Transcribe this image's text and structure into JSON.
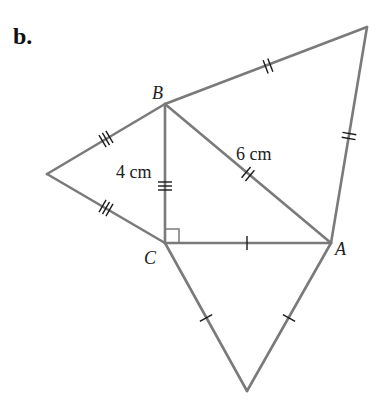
{
  "part_label": "b.",
  "colors": {
    "edge": "#7a7a7a",
    "tick": "#1a1a1a",
    "text": "#222222"
  },
  "vertices": {
    "B": {
      "label": "B",
      "x": 165,
      "y": 104
    },
    "C": {
      "label": "C",
      "x": 165,
      "y": 243
    },
    "A": {
      "label": "A",
      "x": 331,
      "y": 243
    },
    "left_apex": {
      "x": 47,
      "y": 174
    },
    "top_right_apex": {
      "x": 367,
      "y": 27
    },
    "bottom_apex": {
      "x": 247,
      "y": 391
    }
  },
  "measurements": {
    "BC": "4 cm",
    "AB": "6 cm"
  },
  "tick_marks": {
    "BC_and_left_triangle": 3,
    "AB_and_top_triangle": 2,
    "CA_and_bottom_triangle": 1
  },
  "right_angle_at": "C"
}
